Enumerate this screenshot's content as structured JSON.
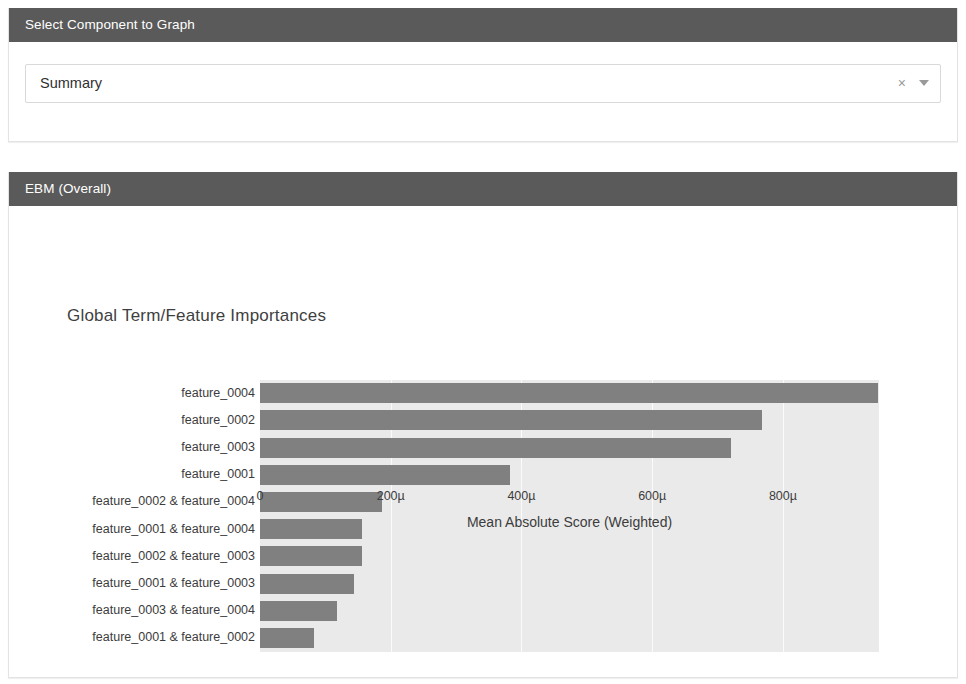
{
  "selector_panel": {
    "header": "Select Component to Graph",
    "dropdown": {
      "value": "Summary",
      "placeholder": "Select component",
      "clear_icon": "×",
      "caret_icon": "chevron-down"
    }
  },
  "chart_panel": {
    "header": "EBM (Overall)"
  },
  "chart_data": {
    "type": "bar",
    "orientation": "horizontal",
    "title": "Global Term/Feature Importances",
    "xlabel": "Mean Absolute Score (Weighted)",
    "ylabel": "",
    "grid": true,
    "legend": null,
    "xlim": [
      0,
      947
    ],
    "unit": "micro (µ)",
    "xtick_labels": [
      "0",
      "200µ",
      "400µ",
      "600µ",
      "800µ"
    ],
    "xtick_values": [
      0,
      200,
      400,
      600,
      800
    ],
    "categories": [
      "feature_0004",
      "feature_0002",
      "feature_0003",
      "feature_0001",
      "feature_0002 & feature_0004",
      "feature_0001 & feature_0004",
      "feature_0002 & feature_0003",
      "feature_0001 & feature_0003",
      "feature_0003 & feature_0004",
      "feature_0001 & feature_0002"
    ],
    "values": [
      946,
      768,
      721,
      383,
      187,
      156,
      156,
      144,
      118,
      83
    ],
    "bar_color": "#808080",
    "plot_background": "#eaeaea"
  },
  "colors": {
    "header_background": "#5a5a5a",
    "header_text": "#ffffff",
    "bar": "#808080",
    "plot_bg": "#eaeaea"
  }
}
